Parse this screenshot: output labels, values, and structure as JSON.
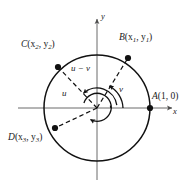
{
  "figure": {
    "axes": {
      "x_label": "x",
      "y_label": "y",
      "origin_label": ""
    },
    "points": [
      {
        "id": "A",
        "name": "A",
        "label_full": "A(1, 0)",
        "coord_text": "(1, 0)",
        "x_text": "1",
        "y_text": "0",
        "angle_deg": 0,
        "px": 150,
        "py": 108,
        "label_x": 152,
        "label_y": 93
      },
      {
        "id": "B",
        "name": "B",
        "label_full": "B(x1, y1)",
        "coord_text": "(x1, y1)",
        "x_text": "x1",
        "y_text": "y1",
        "angle_deg": 62,
        "px": 128,
        "py": 58,
        "label_x": 120,
        "label_y": 36
      },
      {
        "id": "C",
        "name": "C",
        "label_full": "C(x2, y2)",
        "coord_text": "(x2, y2)",
        "x_text": "x2",
        "y_text": "y2",
        "angle_deg": 133,
        "px": 58,
        "py": 67,
        "label_x": 22,
        "label_y": 43
      },
      {
        "id": "D",
        "name": "D",
        "label_full": "D(x3, y3)",
        "coord_text": "(x3, y3)",
        "x_text": "x3",
        "y_text": "y3",
        "angle_deg": 201,
        "px": 55,
        "py": 128,
        "label_x": 9,
        "label_y": 136
      }
    ],
    "angle_arcs": [
      {
        "id": "v",
        "label": "v",
        "from_deg": 0,
        "to_deg": 62,
        "radius_px": 26,
        "label_x": 120,
        "label_y": 88
      },
      {
        "id": "u-minus-v",
        "label": "u − v",
        "minuend": "u",
        "subtrahend": "v",
        "operator": "−",
        "from_deg": 0,
        "to_deg": 133,
        "radius_px": 20,
        "label_x": 72,
        "label_y": 66
      },
      {
        "id": "u",
        "label": "u",
        "from_deg": 201,
        "to_deg": 0,
        "radius_px": 14,
        "label_x": 63,
        "label_y": 92
      }
    ],
    "circle": {
      "center_x": 97,
      "center_y": 108,
      "radius": 53
    },
    "colors": {
      "stroke": "#111111",
      "text": "#1a1a1a",
      "axis": "#4d4d4d",
      "background": "#ffffff"
    }
  }
}
